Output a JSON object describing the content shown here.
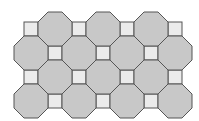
{
  "diagram": {
    "type": "truncated-square-tiling",
    "colors": {
      "background": "#ffffff",
      "octagon_fill": "#c8c8c8",
      "square_fill": "#ebebeb",
      "stroke": "#555555"
    },
    "octagon_size": 34,
    "square_size": 14,
    "octagons": [
      {
        "cx": 55,
        "cy": 29
      },
      {
        "cx": 103,
        "cy": 29
      },
      {
        "cx": 151,
        "cy": 29
      },
      {
        "cx": 31,
        "cy": 53
      },
      {
        "cx": 79,
        "cy": 53
      },
      {
        "cx": 127,
        "cy": 53
      },
      {
        "cx": 175,
        "cy": 53
      },
      {
        "cx": 55,
        "cy": 77
      },
      {
        "cx": 103,
        "cy": 77
      },
      {
        "cx": 151,
        "cy": 77
      },
      {
        "cx": 31,
        "cy": 101
      },
      {
        "cx": 79,
        "cy": 101
      },
      {
        "cx": 127,
        "cy": 101
      },
      {
        "cx": 175,
        "cy": 101
      }
    ],
    "squares": [
      {
        "cx": 31,
        "cy": 29
      },
      {
        "cx": 79,
        "cy": 29
      },
      {
        "cx": 127,
        "cy": 29
      },
      {
        "cx": 175,
        "cy": 29
      },
      {
        "cx": 55,
        "cy": 53
      },
      {
        "cx": 103,
        "cy": 53
      },
      {
        "cx": 151,
        "cy": 53
      },
      {
        "cx": 31,
        "cy": 77
      },
      {
        "cx": 79,
        "cy": 77
      },
      {
        "cx": 127,
        "cy": 77
      },
      {
        "cx": 175,
        "cy": 77
      },
      {
        "cx": 55,
        "cy": 101
      },
      {
        "cx": 103,
        "cy": 101
      },
      {
        "cx": 151,
        "cy": 101
      }
    ]
  }
}
